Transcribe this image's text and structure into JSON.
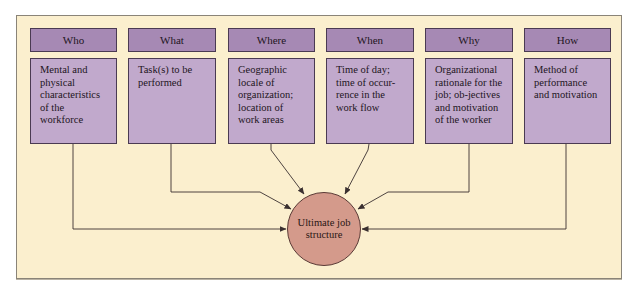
{
  "diagram": {
    "columns": [
      {
        "id": "who",
        "header": "Who",
        "description": "Mental and physical characteristics of the workforce"
      },
      {
        "id": "what",
        "header": "What",
        "description": "Task(s) to be performed"
      },
      {
        "id": "where",
        "header": "Where",
        "description": "Geographic locale of organization; location of work areas"
      },
      {
        "id": "when",
        "header": "When",
        "description": "Time of day; time of occur-rence in the work flow"
      },
      {
        "id": "why",
        "header": "Why",
        "description": "Organizational rationale for the job; ob-jectives and motivation of the worker"
      },
      {
        "id": "how",
        "header": "How",
        "description": "Method of performance and motivation"
      }
    ],
    "hub": {
      "label": "Ultimate job structure"
    },
    "colors": {
      "background": "#fbefce",
      "header_fill": "#a689b4",
      "body_fill": "#c1a9cc",
      "hub_fill": "#d49a8b",
      "line": "#3a3030"
    }
  }
}
